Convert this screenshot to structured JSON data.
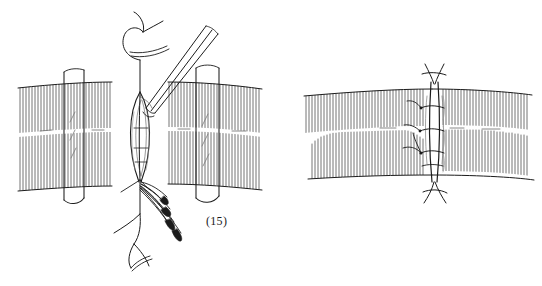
{
  "document": {
    "kind": "surgical-technique-line-drawing",
    "background_color": "#ffffff",
    "ink_color": "#1b1b1b",
    "width": 542,
    "height": 286
  },
  "figures": [
    {
      "id": "15",
      "caption": "(15)",
      "title": "Tendon repair: core suture placed, wound edges retracted",
      "elements": [
        {
          "name": "tendon-body-left",
          "label": "tendon stump, proximal"
        },
        {
          "name": "tendon-body-right",
          "label": "tendon stump, distal"
        },
        {
          "name": "retractor-left",
          "label": "retractor"
        },
        {
          "name": "retractor-right",
          "label": "retractor"
        },
        {
          "name": "incision-gap",
          "label": "repair site gap"
        },
        {
          "name": "needle-holder",
          "label": "needle holder"
        },
        {
          "name": "suture-knot-top",
          "label": "suture, proximal"
        },
        {
          "name": "suture-strands-bottom",
          "label": "suture strands with needles"
        }
      ]
    },
    {
      "id": "16",
      "caption": "(16)",
      "title": "Tendon repair: completed interrupted peripheral suture line",
      "elements": [
        {
          "name": "tendon-body-left",
          "label": "tendon, proximal"
        },
        {
          "name": "tendon-body-right",
          "label": "tendon, distal"
        },
        {
          "name": "repair-seam",
          "label": "closed repair seam"
        },
        {
          "name": "suture-knot-top",
          "label": "knot"
        },
        {
          "name": "suture-knot-bottom",
          "label": "knot"
        }
      ],
      "suture_count": 5
    }
  ],
  "style": {
    "stroke_color": "#1b1b1b",
    "hatch_color": "#2a2a2a",
    "thin_stroke": 0.7,
    "outline_stroke": 1.1
  }
}
